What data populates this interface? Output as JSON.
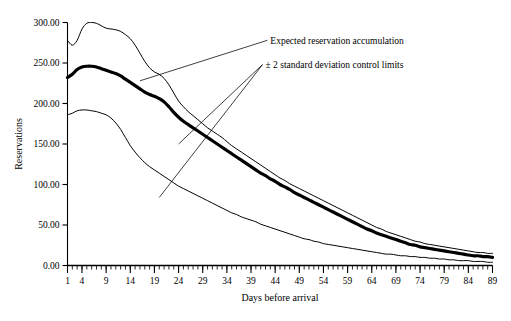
{
  "chart_data": {
    "type": "line",
    "title": "",
    "xlabel": "Days before arrival",
    "ylabel": "Reservations",
    "xlim": [
      1,
      89
    ],
    "ylim": [
      0,
      300
    ],
    "grid": false,
    "legend_position": "none",
    "x_ticks": [
      1,
      4,
      9,
      14,
      19,
      24,
      29,
      34,
      39,
      44,
      49,
      54,
      59,
      64,
      69,
      74,
      79,
      84,
      89
    ],
    "x_tick_labels": [
      "1",
      "4",
      "9",
      "14",
      "19",
      "24",
      "29",
      "34",
      "39",
      "44",
      "49",
      "54",
      "59",
      "64",
      "69",
      "74",
      "79",
      "84",
      "89"
    ],
    "y_ticks": [
      0,
      50,
      100,
      150,
      200,
      250,
      300
    ],
    "y_tick_labels": [
      "0.00",
      "50.00",
      "100.00",
      "150.00",
      "200.00",
      "250.00",
      "300.00"
    ],
    "minor_x_tick_interval": 1,
    "annotations": [
      {
        "name": "expected-accumulation-annotation",
        "text": "Expected reservation accumulation",
        "text_x": 43,
        "text_y": 278,
        "leader_targets": [
          [
            16,
            228
          ]
        ]
      },
      {
        "name": "control-limits-annotation",
        "text": "± 2 standard deviation control limits",
        "text_x": 42,
        "text_y": 248,
        "leader_targets": [
          [
            24,
            150
          ],
          [
            20,
            84
          ]
        ]
      }
    ],
    "series": [
      {
        "name": "Upper 2-sigma control limit",
        "style": "thin",
        "x": [
          1,
          2,
          3,
          4,
          5,
          6,
          7,
          8,
          9,
          10,
          11,
          12,
          13,
          14,
          15,
          16,
          17,
          18,
          19,
          20,
          21,
          22,
          23,
          24,
          25,
          26,
          27,
          28,
          29,
          30,
          31,
          32,
          33,
          34,
          35,
          36,
          37,
          38,
          39,
          40,
          41,
          42,
          43,
          44,
          45,
          46,
          47,
          48,
          49,
          50,
          51,
          52,
          53,
          54,
          55,
          56,
          57,
          58,
          59,
          60,
          61,
          62,
          63,
          64,
          65,
          66,
          67,
          68,
          69,
          70,
          71,
          72,
          73,
          74,
          75,
          76,
          77,
          78,
          79,
          80,
          81,
          82,
          83,
          84,
          85,
          86,
          87,
          88,
          89
        ],
        "values": [
          278,
          272,
          278,
          292,
          299,
          300,
          299,
          296,
          293,
          292,
          291,
          289,
          285,
          280,
          272,
          262,
          252,
          244,
          239,
          236,
          231,
          223,
          213,
          203,
          196,
          190,
          185,
          180,
          175,
          170,
          166,
          162,
          158,
          153,
          148,
          144,
          140,
          136,
          132,
          128,
          124,
          120,
          116,
          112,
          108,
          105,
          101,
          98,
          95,
          92,
          89,
          86,
          83,
          80,
          77,
          74,
          71,
          68,
          65,
          62,
          59,
          56,
          53,
          50,
          47,
          45,
          42,
          40,
          38,
          36,
          34,
          32,
          30,
          29,
          27,
          26,
          25,
          24,
          23,
          22,
          21,
          20,
          19,
          18,
          17,
          16,
          16,
          15,
          15
        ]
      },
      {
        "name": "Expected reservation accumulation",
        "style": "thick",
        "x": [
          1,
          2,
          3,
          4,
          5,
          6,
          7,
          8,
          9,
          10,
          11,
          12,
          13,
          14,
          15,
          16,
          17,
          18,
          19,
          20,
          21,
          22,
          23,
          24,
          25,
          26,
          27,
          28,
          29,
          30,
          31,
          32,
          33,
          34,
          35,
          36,
          37,
          38,
          39,
          40,
          41,
          42,
          43,
          44,
          45,
          46,
          47,
          48,
          49,
          50,
          51,
          52,
          53,
          54,
          55,
          56,
          57,
          58,
          59,
          60,
          61,
          62,
          63,
          64,
          65,
          66,
          67,
          68,
          69,
          70,
          71,
          72,
          73,
          74,
          75,
          76,
          77,
          78,
          79,
          80,
          81,
          82,
          83,
          84,
          85,
          86,
          87,
          88,
          89
        ],
        "values": [
          232,
          236,
          242,
          245,
          246,
          246,
          245,
          243,
          241,
          239,
          237,
          234,
          230,
          226,
          222,
          218,
          214,
          211,
          209,
          206,
          202,
          196,
          189,
          183,
          178,
          174,
          170,
          166,
          162,
          158,
          154,
          150,
          146,
          142,
          138,
          134,
          130,
          126,
          122,
          118,
          114,
          111,
          107,
          104,
          100,
          97,
          94,
          90,
          87,
          84,
          81,
          78,
          75,
          72,
          69,
          66,
          63,
          60,
          57,
          54,
          51,
          48,
          45,
          43,
          40,
          38,
          36,
          34,
          32,
          30,
          28,
          26,
          25,
          23,
          22,
          21,
          20,
          19,
          18,
          17,
          16,
          15,
          14,
          13,
          12,
          12,
          11,
          11,
          10
        ]
      },
      {
        "name": "Lower 2-sigma control limit",
        "style": "thin",
        "x": [
          1,
          2,
          3,
          4,
          5,
          6,
          7,
          8,
          9,
          10,
          11,
          12,
          13,
          14,
          15,
          16,
          17,
          18,
          19,
          20,
          21,
          22,
          23,
          24,
          25,
          26,
          27,
          28,
          29,
          30,
          31,
          32,
          33,
          34,
          35,
          36,
          37,
          38,
          39,
          40,
          41,
          42,
          43,
          44,
          45,
          46,
          47,
          48,
          49,
          50,
          51,
          52,
          53,
          54,
          55,
          56,
          57,
          58,
          59,
          60,
          61,
          62,
          63,
          64,
          65,
          66,
          67,
          68,
          69,
          70,
          71,
          72,
          73,
          74,
          75,
          76,
          77,
          78,
          79,
          80,
          81,
          82,
          83,
          84,
          85,
          86,
          87,
          88,
          89
        ],
        "values": [
          186,
          188,
          191,
          192,
          192,
          191,
          190,
          188,
          186,
          182,
          176,
          168,
          158,
          148,
          140,
          133,
          127,
          122,
          118,
          114,
          110,
          106,
          102,
          98,
          95,
          92,
          89,
          86,
          83,
          80,
          77,
          74,
          71,
          68,
          65,
          63,
          60,
          58,
          56,
          54,
          51,
          49,
          47,
          45,
          43,
          41,
          39,
          37,
          35,
          33,
          32,
          30,
          29,
          27,
          26,
          25,
          24,
          23,
          22,
          21,
          20,
          19,
          18,
          17,
          16,
          15,
          14,
          14,
          13,
          12,
          12,
          11,
          11,
          10,
          10,
          9,
          9,
          8,
          8,
          7,
          7,
          6,
          6,
          6,
          5,
          5,
          5,
          4,
          4
        ]
      }
    ]
  }
}
